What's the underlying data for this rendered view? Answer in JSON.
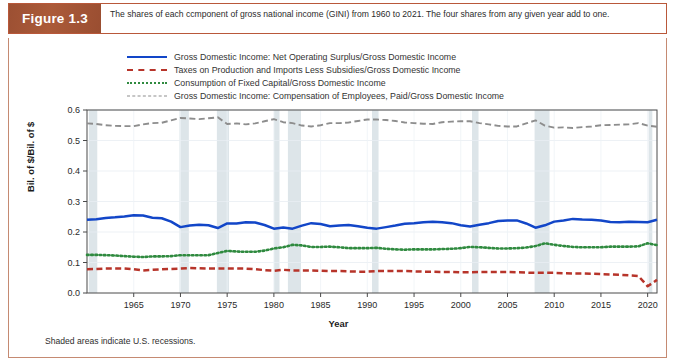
{
  "figure": {
    "label": "Figure 1.3",
    "caption": "The shares of each ccmponent of gross national income (GINI) from 1960 to 2021. The four shares from any given year add to one.",
    "footnote": "Shaded areas indicate U.S. recessions."
  },
  "colors": {
    "blue": "#1246c8",
    "red": "#b7342a",
    "green": "#2f8a3f",
    "gray": "#8d8d8d",
    "label_box": "#a35334",
    "frame": "#c58a72",
    "recession_band": "#dde5e9"
  },
  "chart_data": {
    "type": "line",
    "title": "",
    "xlabel": "Year",
    "ylabel": "Bil. of $/Bil. of $",
    "xlim": [
      1960,
      2021
    ],
    "ylim": [
      0.0,
      0.6
    ],
    "xticks": [
      1965,
      1970,
      1975,
      1980,
      1985,
      1990,
      1995,
      2000,
      2005,
      2010,
      2015,
      2020
    ],
    "yticks": [
      0.0,
      0.1,
      0.2,
      0.3,
      0.4,
      0.5,
      0.6
    ],
    "grid": true,
    "legend_position": "above-plot",
    "annotations": [
      "Shaded areas indicate U.S. recessions."
    ],
    "recessions": [
      [
        1960.2,
        1961.1
      ],
      [
        1969.9,
        1970.9
      ],
      [
        1973.9,
        1975.2
      ],
      [
        1980.0,
        1980.6
      ],
      [
        1981.5,
        1982.9
      ],
      [
        1990.5,
        1991.2
      ],
      [
        2001.2,
        2001.9
      ],
      [
        2007.9,
        2009.5
      ],
      [
        2020.1,
        2020.5
      ]
    ],
    "x": [
      1960,
      1961,
      1962,
      1963,
      1964,
      1965,
      1966,
      1967,
      1968,
      1969,
      1970,
      1971,
      1972,
      1973,
      1974,
      1975,
      1976,
      1977,
      1978,
      1979,
      1980,
      1981,
      1982,
      1983,
      1984,
      1985,
      1986,
      1987,
      1988,
      1989,
      1990,
      1991,
      1992,
      1993,
      1994,
      1995,
      1996,
      1997,
      1998,
      1999,
      2000,
      2001,
      2002,
      2003,
      2004,
      2005,
      2006,
      2007,
      2008,
      2009,
      2010,
      2011,
      2012,
      2013,
      2014,
      2015,
      2016,
      2017,
      2018,
      2019,
      2020,
      2021
    ],
    "series": [
      {
        "name": "Gross Domestic Income: Net Operating Surplus/Gross Domestic Income",
        "color": "#1246c8",
        "style": "solid",
        "values": [
          0.24,
          0.242,
          0.246,
          0.248,
          0.251,
          0.255,
          0.254,
          0.247,
          0.245,
          0.234,
          0.216,
          0.221,
          0.224,
          0.222,
          0.213,
          0.228,
          0.228,
          0.232,
          0.231,
          0.223,
          0.211,
          0.215,
          0.211,
          0.221,
          0.229,
          0.226,
          0.219,
          0.221,
          0.223,
          0.219,
          0.214,
          0.211,
          0.216,
          0.221,
          0.227,
          0.229,
          0.232,
          0.234,
          0.232,
          0.229,
          0.222,
          0.218,
          0.224,
          0.229,
          0.236,
          0.238,
          0.238,
          0.228,
          0.214,
          0.222,
          0.234,
          0.238,
          0.243,
          0.241,
          0.24,
          0.238,
          0.233,
          0.232,
          0.234,
          0.233,
          0.232,
          0.24
        ]
      },
      {
        "name": "Taxes on Production and Imports Less Subsidies/Gross Domestic Income",
        "color": "#b7342a",
        "style": "dashed",
        "values": [
          0.078,
          0.079,
          0.08,
          0.08,
          0.08,
          0.078,
          0.074,
          0.076,
          0.078,
          0.079,
          0.08,
          0.082,
          0.081,
          0.08,
          0.08,
          0.08,
          0.08,
          0.08,
          0.078,
          0.075,
          0.073,
          0.076,
          0.074,
          0.074,
          0.074,
          0.073,
          0.072,
          0.072,
          0.071,
          0.07,
          0.07,
          0.072,
          0.072,
          0.072,
          0.072,
          0.071,
          0.07,
          0.07,
          0.069,
          0.069,
          0.068,
          0.068,
          0.069,
          0.069,
          0.069,
          0.069,
          0.068,
          0.067,
          0.066,
          0.066,
          0.066,
          0.065,
          0.064,
          0.064,
          0.063,
          0.062,
          0.061,
          0.06,
          0.058,
          0.056,
          0.022,
          0.043
        ]
      },
      {
        "name": "Consumption of Fixed Capital/Gross Domestic Income",
        "color": "#2f8a3f",
        "style": "dotted",
        "values": [
          0.125,
          0.125,
          0.124,
          0.123,
          0.121,
          0.119,
          0.118,
          0.12,
          0.12,
          0.121,
          0.124,
          0.124,
          0.124,
          0.124,
          0.131,
          0.138,
          0.136,
          0.135,
          0.135,
          0.139,
          0.146,
          0.15,
          0.158,
          0.156,
          0.151,
          0.151,
          0.152,
          0.15,
          0.147,
          0.147,
          0.147,
          0.148,
          0.145,
          0.143,
          0.142,
          0.143,
          0.143,
          0.143,
          0.144,
          0.145,
          0.147,
          0.151,
          0.15,
          0.148,
          0.146,
          0.146,
          0.147,
          0.149,
          0.154,
          0.163,
          0.158,
          0.154,
          0.151,
          0.15,
          0.15,
          0.15,
          0.152,
          0.152,
          0.152,
          0.153,
          0.163,
          0.157
        ]
      },
      {
        "name": "Gross Domestic Income: Compensation of Employees, Paid/Gross Domestic Income",
        "color": "#8d8d8d",
        "style": "dashed",
        "values": [
          0.556,
          0.554,
          0.55,
          0.548,
          0.547,
          0.547,
          0.553,
          0.557,
          0.558,
          0.566,
          0.574,
          0.572,
          0.57,
          0.573,
          0.576,
          0.554,
          0.556,
          0.553,
          0.556,
          0.563,
          0.57,
          0.56,
          0.557,
          0.549,
          0.546,
          0.55,
          0.557,
          0.557,
          0.559,
          0.564,
          0.569,
          0.569,
          0.567,
          0.564,
          0.559,
          0.557,
          0.555,
          0.554,
          0.56,
          0.562,
          0.563,
          0.563,
          0.557,
          0.553,
          0.548,
          0.546,
          0.546,
          0.556,
          0.566,
          0.549,
          0.542,
          0.543,
          0.541,
          0.544,
          0.546,
          0.55,
          0.551,
          0.552,
          0.553,
          0.557,
          0.549,
          0.545
        ]
      }
    ]
  }
}
